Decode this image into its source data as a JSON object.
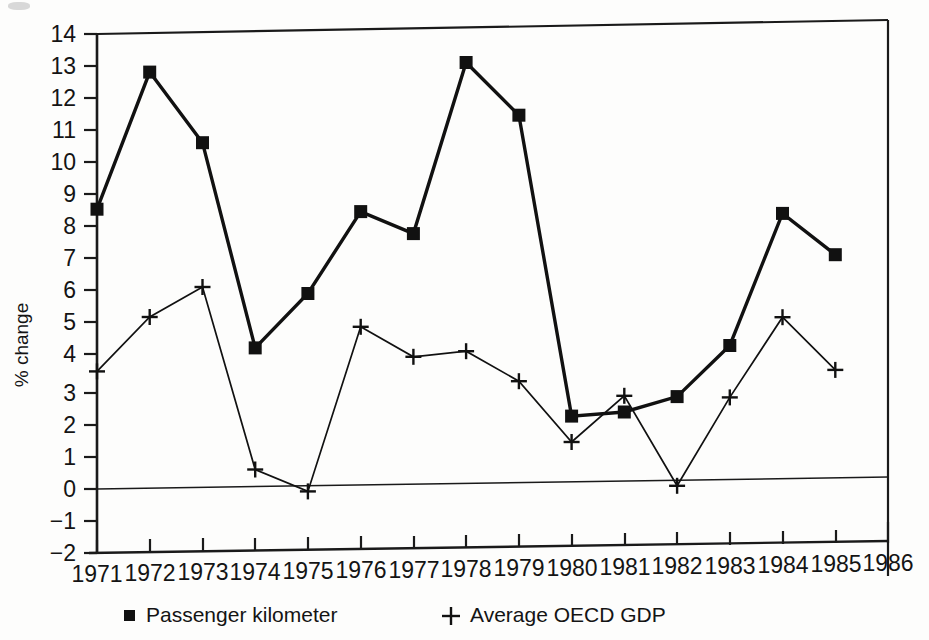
{
  "chart_data": {
    "type": "line",
    "title": "",
    "xlabel": "",
    "ylabel": "% change",
    "xlim": [
      1971,
      1986
    ],
    "ylim": [
      -2,
      14
    ],
    "ytick_labels": [
      "14",
      "13",
      "12",
      "11",
      "10",
      "9",
      "8",
      "7",
      "6",
      "5",
      "4",
      "3",
      "2",
      "1",
      "0",
      "−1",
      "−2"
    ],
    "ytick_values": [
      14,
      13,
      12,
      11,
      10,
      9,
      8,
      7,
      6,
      5,
      4,
      3,
      2,
      1,
      0,
      -1,
      -2
    ],
    "xtick_labels": [
      "1971",
      "1972",
      "1973",
      "1974",
      "1975",
      "1976",
      "1977",
      "1978",
      "1979",
      "1980",
      "1981",
      "1982",
      "1983",
      "1984",
      "1985",
      "1986"
    ],
    "x": [
      1971,
      1972,
      1973,
      1974,
      1975,
      1976,
      1977,
      1978,
      1979,
      1980,
      1981,
      1982,
      1983,
      1984,
      1985
    ],
    "grid": false,
    "legend_position": "below-axis",
    "zero_line": true,
    "series": [
      {
        "name": "Passenger kilometer",
        "marker": "square",
        "values": [
          8.6,
          12.8,
          10.6,
          4.25,
          5.9,
          8.4,
          7.7,
          12.95,
          11.3,
          2.0,
          2.1,
          2.55,
          4.1,
          8.15,
          6.85
        ]
      },
      {
        "name": "Average OECD GDP",
        "marker": "plus",
        "values": [
          3.6,
          5.25,
          6.15,
          0.5,
          -0.2,
          4.85,
          3.9,
          4.05,
          3.1,
          1.2,
          2.6,
          -0.2,
          2.5,
          4.95,
          3.3
        ]
      }
    ]
  },
  "legend": {
    "items": [
      {
        "marker_glyph": "■",
        "label": "Passenger kilometer"
      },
      {
        "marker_glyph": "+",
        "label": "Average OECD GDP"
      }
    ]
  },
  "colors": {
    "ink": "#111111",
    "paper": "#fdfdfc"
  }
}
